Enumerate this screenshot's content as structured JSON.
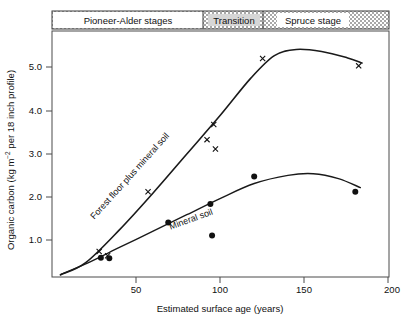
{
  "chart_data": {
    "type": "scatter",
    "title": "",
    "xlabel": "Estimated surface age (years)",
    "ylabel": "Organic carbon (kg m−2 per 18 inch profile)",
    "ylabel_parts": {
      "pre": "Organic carbon (kg m",
      "sup": "−2",
      "post": " per 18 inch profile)"
    },
    "xlim": [
      0,
      200
    ],
    "ylim": [
      0,
      6.0
    ],
    "xticks": [
      50,
      100,
      150,
      200
    ],
    "xtick_labels": [
      "50",
      "100",
      "150",
      "200"
    ],
    "yticks": [
      1.0,
      2.0,
      3.0,
      4.0,
      5.0
    ],
    "ytick_labels": [
      "1.0",
      "2.0",
      "3.0",
      "4.0",
      "5.0"
    ],
    "grid": false,
    "legend_position": "inline-curve-labels",
    "series": [
      {
        "name": "Forest floor plus mineral soil",
        "marker": "x",
        "label_text": "Forest floor plus mineral soil",
        "label_rotation_deg": -48,
        "points": [
          {
            "x": 28,
            "y": 0.62
          },
          {
            "x": 33,
            "y": 0.52
          },
          {
            "x": 57,
            "y": 2.08
          },
          {
            "x": 92,
            "y": 3.35
          },
          {
            "x": 96,
            "y": 3.72
          },
          {
            "x": 97,
            "y": 3.12
          },
          {
            "x": 125,
            "y": 5.33
          },
          {
            "x": 182,
            "y": 5.15
          }
        ],
        "fit_curve": [
          {
            "x": 5,
            "y": 0.05
          },
          {
            "x": 20,
            "y": 0.35
          },
          {
            "x": 40,
            "y": 1.15
          },
          {
            "x": 60,
            "y": 2.05
          },
          {
            "x": 80,
            "y": 3.0
          },
          {
            "x": 100,
            "y": 3.95
          },
          {
            "x": 118,
            "y": 4.85
          },
          {
            "x": 132,
            "y": 5.4
          },
          {
            "x": 145,
            "y": 5.55
          },
          {
            "x": 160,
            "y": 5.5
          },
          {
            "x": 175,
            "y": 5.35
          },
          {
            "x": 184,
            "y": 5.22
          }
        ]
      },
      {
        "name": "Mineral soil",
        "marker": "filled-circle",
        "label_text": "Mineral soil",
        "label_rotation_deg": -20,
        "points": [
          {
            "x": 29,
            "y": 0.47
          },
          {
            "x": 34,
            "y": 0.46
          },
          {
            "x": 69,
            "y": 1.33
          },
          {
            "x": 94,
            "y": 1.78
          },
          {
            "x": 95,
            "y": 1.01
          },
          {
            "x": 120,
            "y": 2.45
          },
          {
            "x": 180,
            "y": 2.08
          }
        ],
        "fit_curve": [
          {
            "x": 5,
            "y": 0.06
          },
          {
            "x": 20,
            "y": 0.32
          },
          {
            "x": 40,
            "y": 0.72
          },
          {
            "x": 60,
            "y": 1.12
          },
          {
            "x": 80,
            "y": 1.52
          },
          {
            "x": 100,
            "y": 1.92
          },
          {
            "x": 120,
            "y": 2.28
          },
          {
            "x": 140,
            "y": 2.48
          },
          {
            "x": 155,
            "y": 2.52
          },
          {
            "x": 170,
            "y": 2.4
          },
          {
            "x": 183,
            "y": 2.18
          }
        ]
      }
    ]
  },
  "banner": {
    "segments": [
      {
        "label": "Pioneer-Alder stages",
        "fill": "white",
        "x_start": 0,
        "x_end": 90
      },
      {
        "label": "Transition",
        "fill": "hatched",
        "x_start": 90,
        "x_end": 125
      },
      {
        "label": "Spruce stage",
        "fill": "hatched",
        "x_start": 125,
        "x_end": 200
      }
    ]
  },
  "colors": {
    "line": "#1a1a1a",
    "frame": "#444444",
    "text": "#111111",
    "hatch": "#9a9a9a",
    "background": "#ffffff"
  }
}
